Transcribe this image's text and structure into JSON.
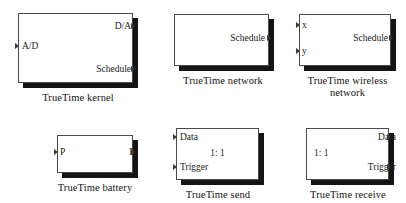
{
  "library": {
    "name": "TrueTime block library",
    "background_color": "#ffffff",
    "block_fill_color": "#ffffff",
    "block_border_color": "#4a4a4a",
    "shadow_color": "#141414"
  },
  "blocks": [
    {
      "id": "truetime-kernel",
      "caption": "TrueTime kernel",
      "inputs": [
        {
          "label": "A/D"
        }
      ],
      "outputs": [
        {
          "label": "D/A"
        },
        {
          "label": "Schedule"
        }
      ],
      "center_label": ""
    },
    {
      "id": "truetime-network",
      "caption": "TrueTime network",
      "inputs": [],
      "outputs": [
        {
          "label": "Schedule"
        }
      ],
      "center_label": ""
    },
    {
      "id": "truetime-wireless-network",
      "caption": "TrueTime wireless\nnetwork",
      "inputs": [
        {
          "label": "x"
        },
        {
          "label": "y"
        }
      ],
      "outputs": [
        {
          "label": "Schedule"
        }
      ],
      "center_label": ""
    },
    {
      "id": "truetime-battery",
      "caption": "TrueTime battery",
      "inputs": [
        {
          "label": "P"
        }
      ],
      "outputs": [
        {
          "label": "E"
        }
      ],
      "center_label": ""
    },
    {
      "id": "truetime-send",
      "caption": "TrueTime send",
      "inputs": [
        {
          "label": "Data"
        },
        {
          "label": "Trigger"
        }
      ],
      "outputs": [],
      "center_label": "1: 1"
    },
    {
      "id": "truetime-receive",
      "caption": "TrueTime receive",
      "inputs": [],
      "outputs": [
        {
          "label": "Data"
        },
        {
          "label": "Trigger"
        }
      ],
      "center_label": "1: 1"
    }
  ]
}
